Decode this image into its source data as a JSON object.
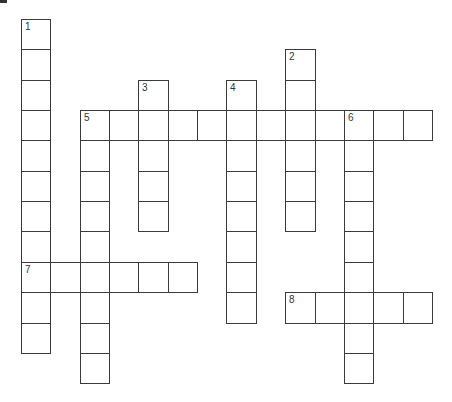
{
  "puzzle": {
    "type": "crossword",
    "grid": {
      "origin_x": 21,
      "origin_y": 19,
      "cell_width": 29.35,
      "cell_height": 30.35,
      "cols": 14,
      "rows": 12
    },
    "colors": {
      "line": "#3a3a3a",
      "number": "#333333",
      "background": "#ffffff"
    },
    "entries": [
      {
        "number": "1",
        "direction": "down",
        "row": 0,
        "col": 0,
        "length": 11
      },
      {
        "number": "2",
        "direction": "down",
        "row": 1,
        "col": 9,
        "length": 6
      },
      {
        "number": "3",
        "direction": "down",
        "row": 2,
        "col": 4,
        "length": 5
      },
      {
        "number": "4",
        "direction": "down",
        "row": 2,
        "col": 7,
        "length": 8
      },
      {
        "number": "5",
        "direction": "across",
        "row": 3,
        "col": 2,
        "length": 12
      },
      {
        "number": "5",
        "direction": "down",
        "row": 3,
        "col": 2,
        "length": 9
      },
      {
        "number": "6",
        "direction": "down",
        "row": 3,
        "col": 11,
        "length": 9
      },
      {
        "number": "7",
        "direction": "across",
        "row": 8,
        "col": 0,
        "length": 6
      },
      {
        "number": "8",
        "direction": "across",
        "row": 9,
        "col": 9,
        "length": 5
      }
    ]
  }
}
